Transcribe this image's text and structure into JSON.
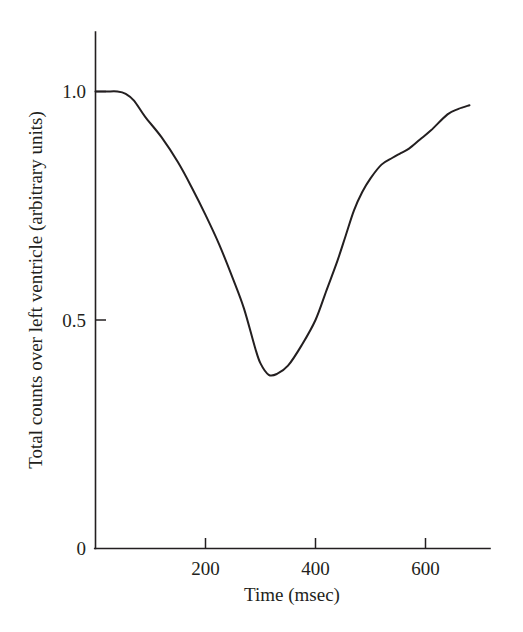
{
  "chart_data": {
    "type": "line",
    "title": "",
    "xlabel": "Time (msec)",
    "ylabel": "Total counts over left ventricle (arbitrary units)",
    "xlim": [
      0,
      718
    ],
    "ylim": [
      0,
      1.09
    ],
    "grid": false,
    "legend": null,
    "x_ticks": [
      200,
      400,
      600
    ],
    "x_tick_labels": [
      "200",
      "400",
      "600"
    ],
    "y_ticks": [
      0,
      0.5,
      1.0
    ],
    "y_tick_labels": [
      "0",
      "0.5",
      "1.0"
    ],
    "line_color": "#231f20",
    "series": [
      {
        "name": "Total counts over left ventricle",
        "x": [
          0,
          20,
          40,
          55,
          70,
          90,
          120,
          150,
          175,
          200,
          225,
          250,
          270,
          290,
          300,
          315,
          330,
          350,
          375,
          400,
          420,
          440,
          455,
          470,
          485,
          500,
          520,
          540,
          555,
          570,
          590,
          610,
          640,
          660,
          680
        ],
        "y": [
          1.0,
          1.0,
          1.0,
          0.995,
          0.98,
          0.945,
          0.9,
          0.845,
          0.79,
          0.73,
          0.665,
          0.59,
          0.525,
          0.44,
          0.405,
          0.38,
          0.382,
          0.4,
          0.445,
          0.5,
          0.565,
          0.63,
          0.685,
          0.74,
          0.78,
          0.81,
          0.84,
          0.855,
          0.865,
          0.875,
          0.895,
          0.915,
          0.95,
          0.962,
          0.97
        ]
      }
    ],
    "annotations": {
      "plateau_start_value": 1.0,
      "minimum_time": 315,
      "minimum_value": 0.38,
      "end_time": 680,
      "end_value": 0.97
    }
  },
  "axes": {
    "x_title": "Time (msec)",
    "y_title": "Total counts over left ventricle (arbitrary units)",
    "x_tick_labels": [
      "200",
      "400",
      "600"
    ],
    "y_tick_labels": [
      "1.0",
      "0.5",
      "0"
    ]
  }
}
